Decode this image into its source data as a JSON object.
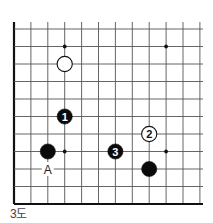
{
  "diagram": {
    "type": "go-board-fragment",
    "caption": "3도",
    "top_caption": "2도",
    "grid": {
      "x0": 14,
      "dx": 16.9,
      "columns": 12,
      "y0": 29,
      "dy": 17.5,
      "rows": 11,
      "left_edge": true,
      "bottom_edge": true,
      "line_color": "#555555",
      "edge_color": "#111111"
    },
    "star_points": [
      {
        "col": 3,
        "row": 1
      },
      {
        "col": 9,
        "row": 1
      },
      {
        "col": 3,
        "row": 7
      },
      {
        "col": 9,
        "row": 7
      }
    ],
    "stones": [
      {
        "color": "white",
        "col": 3,
        "row": 2,
        "label": ""
      },
      {
        "color": "black",
        "col": 3,
        "row": 5,
        "label": "1"
      },
      {
        "color": "black",
        "col": 2,
        "row": 7,
        "label": ""
      },
      {
        "color": "white",
        "col": 8,
        "row": 6,
        "label": "2"
      },
      {
        "color": "black",
        "col": 6,
        "row": 7,
        "label": "3"
      },
      {
        "color": "black",
        "col": 8,
        "row": 8,
        "label": ""
      }
    ],
    "marks": [
      {
        "text": "A",
        "col": 2,
        "row": 8
      }
    ]
  }
}
